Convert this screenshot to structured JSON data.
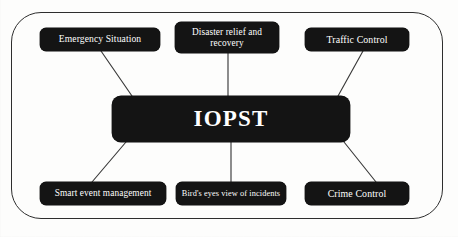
{
  "diagram": {
    "title": "IOPST",
    "center": {
      "id": "iopst",
      "label": "IOPST"
    },
    "colors": {
      "node_fill": "#141414",
      "node_text": "#ffffff",
      "frame_border": "#2e2e2e",
      "connector": "#3a3a3a",
      "background": "#fdfdfc"
    },
    "nodes": [
      {
        "id": "emergency-situation",
        "label": "Emergency Situation",
        "position": "top-left"
      },
      {
        "id": "disaster-relief",
        "label": "Disaster relief and\nrecovery",
        "position": "top-center"
      },
      {
        "id": "traffic-control",
        "label": "Traffic Control",
        "position": "top-right"
      },
      {
        "id": "smart-event-management",
        "label": "Smart event management",
        "position": "bottom-left"
      },
      {
        "id": "birds-eye-view",
        "label": "Bird's eyes view of incidents",
        "position": "bottom-center"
      },
      {
        "id": "crime-control",
        "label": "Crime Control",
        "position": "bottom-right"
      }
    ],
    "connections": [
      {
        "from": "iopst",
        "to": "emergency-situation"
      },
      {
        "from": "iopst",
        "to": "disaster-relief"
      },
      {
        "from": "iopst",
        "to": "traffic-control"
      },
      {
        "from": "iopst",
        "to": "smart-event-management"
      },
      {
        "from": "iopst",
        "to": "birds-eye-view"
      },
      {
        "from": "iopst",
        "to": "crime-control"
      }
    ]
  }
}
